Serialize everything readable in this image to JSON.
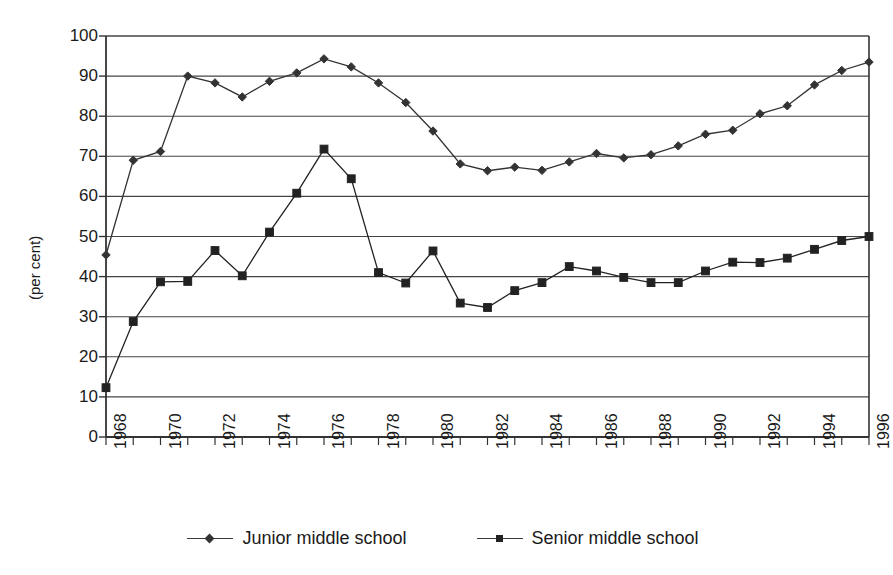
{
  "chart_data": {
    "type": "line",
    "title": "",
    "xlabel": "",
    "ylabel": "(per cent)",
    "ylim": [
      0,
      100
    ],
    "ytick_step": 10,
    "yticks": [
      100,
      90,
      80,
      70,
      60,
      50,
      40,
      30,
      20,
      10,
      0
    ],
    "grid": true,
    "grid_axis": "y",
    "legend_position": "bottom",
    "x": [
      1968,
      1969,
      1970,
      1971,
      1972,
      1973,
      1974,
      1975,
      1976,
      1977,
      1978,
      1979,
      1980,
      1981,
      1982,
      1983,
      1984,
      1985,
      1986,
      1987,
      1988,
      1989,
      1990,
      1991,
      1992,
      1993,
      1994,
      1995,
      1996
    ],
    "xtick_labels": [
      "1968",
      "1970",
      "1972",
      "1974",
      "1976",
      "1978",
      "1980",
      "1982",
      "1984",
      "1986",
      "1988",
      "1990",
      "1992",
      "1994",
      "1996"
    ],
    "xtick_values": [
      1968,
      1970,
      1972,
      1974,
      1976,
      1978,
      1980,
      1982,
      1984,
      1986,
      1988,
      1990,
      1992,
      1994,
      1996
    ],
    "series": [
      {
        "name": "Junior middle school",
        "marker": "diamond",
        "color": "#333333",
        "values": [
          45.4,
          69.0,
          71.2,
          90.0,
          88.3,
          84.8,
          88.7,
          90.8,
          94.3,
          92.3,
          88.3,
          83.4,
          76.3,
          68.1,
          66.4,
          67.3,
          66.5,
          68.6,
          70.7,
          69.6,
          70.4,
          72.6,
          75.5,
          76.5,
          80.6,
          82.6,
          87.8,
          91.4,
          93.5
        ]
      },
      {
        "name": "Senior middle school",
        "marker": "square",
        "color": "#222222",
        "values": [
          12.3,
          28.8,
          38.7,
          38.8,
          46.5,
          40.2,
          51.1,
          60.8,
          71.8,
          64.4,
          41.0,
          38.4,
          46.4,
          33.4,
          32.3,
          36.5,
          38.5,
          42.5,
          41.4,
          39.8,
          38.5,
          38.5,
          41.4,
          43.6,
          43.5,
          44.6,
          46.8,
          49.0,
          50.0
        ]
      }
    ]
  },
  "legend": {
    "items": [
      {
        "label": "Junior middle school",
        "marker": "diamond"
      },
      {
        "label": "Senior middle school",
        "marker": "square"
      }
    ]
  }
}
